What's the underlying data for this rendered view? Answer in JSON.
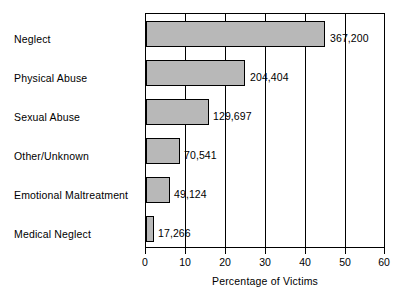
{
  "chart_data": {
    "type": "bar",
    "orientation": "horizontal",
    "title": "",
    "xlabel": "Percentage of Victims",
    "ylabel": "",
    "xlim": [
      0,
      60
    ],
    "xticks": [
      0,
      10,
      20,
      30,
      40,
      50,
      60
    ],
    "grid": true,
    "legend": null,
    "categories": [
      "Neglect",
      "Physical Abuse",
      "Sexual Abuse",
      "Other/Unknown",
      "Emotional Maltreatment",
      "Medical Neglect"
    ],
    "values": [
      45.0,
      25.0,
      15.9,
      8.6,
      6.0,
      2.1
    ],
    "data_labels": [
      "367,200",
      "204,404",
      "129,697",
      "70,541",
      "49,124",
      "17,266"
    ],
    "counts": [
      367200,
      204404,
      129697,
      70541,
      49124,
      17266
    ],
    "bar_color": "#b8b8b8",
    "bar_edge_color": "#000000"
  }
}
